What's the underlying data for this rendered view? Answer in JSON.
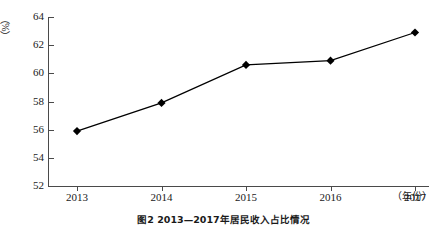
{
  "chart_data": {
    "type": "line",
    "title": "图2  2013—2017年居民收入占比情况",
    "xlabel": "（年份）",
    "ylabel": "（%）",
    "categories": [
      "2013",
      "2014",
      "2015",
      "2016",
      "2017"
    ],
    "values": [
      55.9,
      57.9,
      60.6,
      60.9,
      62.9
    ],
    "series": [
      {
        "name": "占比",
        "values": [
          55.9,
          57.9,
          60.6,
          60.9,
          62.9
        ]
      }
    ],
    "ylim": [
      52,
      64
    ],
    "yticks": [
      52,
      54,
      56,
      58,
      60,
      62,
      64
    ],
    "ytick_labels": [
      "52",
      "54",
      "56",
      "58",
      "60",
      "62",
      "64"
    ],
    "grid": false,
    "legend": false,
    "marker": "diamond",
    "line_color": "#000000",
    "marker_color": "#000000",
    "axis_color": "#4a4a4a",
    "background": "#ffffff"
  },
  "axes": {
    "y_unit": "（%）",
    "x_unit": "（年份）"
  },
  "caption": {
    "text": "图2  2013—2017年居民收入占比情况"
  }
}
